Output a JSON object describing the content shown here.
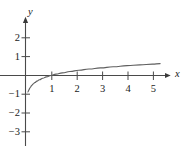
{
  "chart_data": {
    "type": "line",
    "title": "",
    "subtitle": "",
    "xlabel": "x",
    "ylabel": "y",
    "function_label": "y = log(x)",
    "grid": false,
    "legend": null,
    "xlim": [
      -0.9,
      5.8
    ],
    "ylim": [
      -3.6,
      2.8
    ],
    "xticks": [
      1,
      2,
      3,
      4,
      5
    ],
    "xtick_labels": [
      "1",
      "2",
      "3",
      "4",
      "5"
    ],
    "yticks": [
      2,
      1,
      -1,
      -2,
      -3
    ],
    "ytick_labels": [
      "2",
      "1",
      "−1",
      "−2",
      "−3"
    ],
    "axis_arrow_x": true,
    "axis_arrow_y": true,
    "curve_color": "#5f5f5f",
    "axis_color": "#4a4a4a",
    "text_color": "#1a1a1a",
    "series": [
      {
        "name": "log curve",
        "x": [
          0.095,
          0.105,
          0.12,
          0.14,
          0.165,
          0.2,
          0.24,
          0.3,
          0.37,
          0.45,
          0.55,
          0.68,
          0.82,
          1.0,
          1.2,
          1.45,
          1.75,
          2.1,
          2.5,
          2.95,
          3.45,
          4.0,
          4.5,
          5.0,
          5.3
        ],
        "y": [
          -2.02,
          -1.95,
          -1.84,
          -1.72,
          -1.58,
          -1.4,
          -1.24,
          -1.04,
          -0.86,
          -0.69,
          -0.52,
          -0.34,
          -0.17,
          0.0,
          0.16,
          0.32,
          0.49,
          0.64,
          0.79,
          0.93,
          1.07,
          1.2,
          1.3,
          1.4,
          1.46
        ],
        "y_display_scale": 0.435
      }
    ],
    "asymptote": {
      "type": "vertical",
      "x": 0
    },
    "x_intercept": 1
  },
  "axes": {
    "x_axis_name": "x",
    "y_axis_name": "y"
  }
}
